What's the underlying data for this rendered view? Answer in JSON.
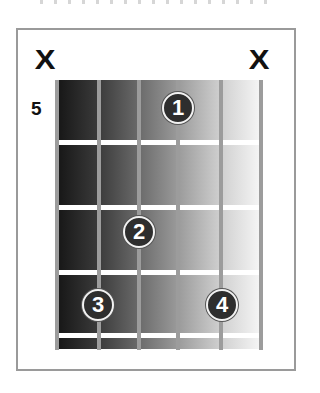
{
  "diagram": {
    "type": "guitar-chord-diagram",
    "start_fret_label": "5",
    "string_markers": [
      {
        "string": 6,
        "marker": "X",
        "meaning": "muted"
      },
      {
        "string": 1,
        "marker": "X",
        "meaning": "muted"
      }
    ],
    "fingers": [
      {
        "label": "1",
        "string": 2,
        "fret_offset": 1
      },
      {
        "label": "2",
        "string": 4,
        "fret_offset": 2
      },
      {
        "label": "3",
        "string": 5,
        "fret_offset": 3
      },
      {
        "label": "4",
        "string": 2,
        "fret_offset": 3
      }
    ],
    "strings": 6,
    "frets_shown": 4,
    "colors": {
      "finger_fill": "#2e2e2e",
      "finger_text": "#ffffff",
      "string": "#9c9c9c",
      "fret": "#ffffff",
      "frame": "#9a9a9a",
      "board_gradient_start": "#161616",
      "board_gradient_end": "#f6f6f6"
    }
  },
  "labels": {
    "mute_left": "X",
    "mute_right": "X",
    "fret_number": "5",
    "finger_1": "1",
    "finger_2": "2",
    "finger_3": "3",
    "finger_4": "4"
  }
}
